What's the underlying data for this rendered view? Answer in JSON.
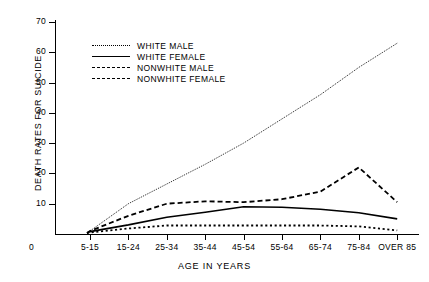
{
  "chart_data": {
    "type": "line",
    "title": "",
    "xlabel": "AGE IN YEARS",
    "ylabel": "DEATH RATES FOR SUICIDE",
    "categories": [
      "5-15",
      "15-24",
      "25-34",
      "35-44",
      "45-54",
      "55-64",
      "65-74",
      "75-84",
      "OVER 85"
    ],
    "origin_label": "0",
    "ylim": [
      0,
      70
    ],
    "yticks": [
      10,
      20,
      30,
      40,
      50,
      60,
      70
    ],
    "ytick_labels": [
      "10",
      "20",
      "30",
      "40",
      "50",
      "60",
      "70"
    ],
    "grid": false,
    "legend_position": "upper-left-inside",
    "series": [
      {
        "name": "WHITE MALE",
        "style": "dotted",
        "color": "#000000",
        "values": [
          1.0,
          10.0,
          16.5,
          23.0,
          30.0,
          38.0,
          46.0,
          55.0,
          63.0
        ]
      },
      {
        "name": "WHITE FEMALE",
        "style": "solid",
        "color": "#000000",
        "values": [
          0.8,
          3.0,
          5.5,
          7.2,
          9.0,
          8.8,
          8.2,
          7.0,
          5.0
        ]
      },
      {
        "name": "NONWHITE MALE",
        "style": "dashed",
        "color": "#000000",
        "values": [
          1.0,
          6.0,
          10.0,
          10.8,
          10.5,
          11.5,
          14.0,
          22.0,
          10.5
        ]
      },
      {
        "name": "NONWHITE FEMALE",
        "style": "dashed-fine",
        "color": "#000000",
        "values": [
          0.5,
          1.8,
          2.8,
          2.8,
          2.8,
          2.8,
          2.8,
          2.5,
          1.2
        ]
      }
    ]
  },
  "legend": {
    "items": [
      {
        "label": "WHITE MALE",
        "style": "dotted"
      },
      {
        "label": "WHITE FEMALE",
        "style": "solid"
      },
      {
        "label": "NONWHITE MALE",
        "style": "dashed"
      },
      {
        "label": "NONWHITE FEMALE",
        "style": "dashed-fine"
      }
    ]
  }
}
